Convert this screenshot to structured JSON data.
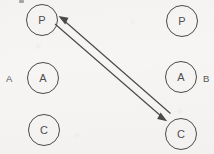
{
  "figure": {
    "background_color": "#f6f5f3",
    "stroke_color": "#4a4a4a",
    "text_color": "#4e4e4e",
    "width": 214,
    "height": 154
  },
  "columns": [
    {
      "id": "A",
      "label": "A",
      "side": "left"
    },
    {
      "id": "B",
      "label": "B",
      "side": "right"
    }
  ],
  "nodes": [
    {
      "id": "left-p",
      "label": "P",
      "column": "A",
      "cx": 42,
      "cy": 20,
      "r": 16
    },
    {
      "id": "left-a",
      "label": "A",
      "column": "A",
      "cx": 43,
      "cy": 78,
      "r": 16
    },
    {
      "id": "left-c",
      "label": "C",
      "column": "A",
      "cx": 44,
      "cy": 130,
      "r": 16
    },
    {
      "id": "right-p",
      "label": "P",
      "column": "B",
      "cx": 182,
      "cy": 21,
      "r": 16
    },
    {
      "id": "right-a",
      "label": "A",
      "column": "B",
      "cx": 181,
      "cy": 77,
      "r": 16
    },
    {
      "id": "right-c",
      "label": "C",
      "column": "B",
      "cx": 181,
      "cy": 134,
      "r": 16
    }
  ],
  "connections": [
    {
      "id": "p-to-c",
      "from": "left-p",
      "to": "right-c",
      "style": "double-headed-parallel-lines",
      "heads": 2,
      "lines": 2
    }
  ],
  "annotations": {
    "scan_artifact": "speck"
  }
}
